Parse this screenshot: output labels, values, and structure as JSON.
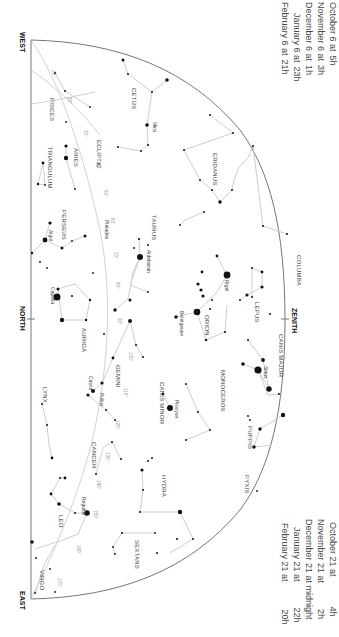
{
  "chart": {
    "directions": {
      "west": "WEST",
      "north": "NORTH",
      "east": "EAST",
      "zenith": "ZENITH"
    },
    "ecliptic_label": "ECLIPTIC",
    "ecliptic_degrees": [
      "10°",
      "20°",
      "30°",
      "40°",
      "50°",
      "60°",
      "70°",
      "80°",
      "90°",
      "100°",
      "110°",
      "120°",
      "130°",
      "140°",
      "150°",
      "160°",
      "170°"
    ],
    "constellations": {
      "pisces": "PISCES",
      "cetus": "CETUS",
      "aries": "ARIES",
      "triangulum": "TRIANGULUM",
      "perseus": "PERSEUS",
      "eridanus": "ERIDANUS",
      "taurus": "TAURUS",
      "auriga": "AURIGA",
      "orion": "ORION",
      "lepus": "LEPUS",
      "columba": "COLUMBA",
      "gemini": "GEMINI",
      "canis_major": "CANIS MAJOR",
      "canis_minor": "CANIS MINOR",
      "monoceros": "MONOCEROS",
      "lynx": "LYNX",
      "cancer": "CANCER",
      "puppis": "PUPPIS",
      "pyxis": "PYXIS",
      "hydra": "HYDRA",
      "leo": "LEO",
      "sextans": "SEXTANS",
      "virgo": "VIRGO"
    },
    "stars": {
      "mira": "Mira",
      "algol": "Algol",
      "pleiades": "Pleiades",
      "aldebaran": "Aldebaran",
      "capella": "Capella",
      "rigel": "Rigel",
      "betelgeuse": "Betelgeuse",
      "sirius": "Sirius",
      "procyon": "Procyon",
      "castor": "Castor",
      "pollux": "Pollux",
      "regulus": "Regulus"
    }
  },
  "viewing_times_early": [
    {
      "date": "October 6 at",
      "time": "5h"
    },
    {
      "date": "November 6 at",
      "time": "3h"
    },
    {
      "date": "December 6 at",
      "time": "1h"
    },
    {
      "date": "January 6 at",
      "time": "23h"
    },
    {
      "date": "February 6 at",
      "time": "21h"
    }
  ],
  "viewing_times_late": [
    {
      "date": "October 21 at",
      "time": "4h"
    },
    {
      "date": "November 21 at",
      "time": "2h"
    },
    {
      "date": "December 21 at midnight",
      "time": ""
    },
    {
      "date": "January 21 at",
      "time": "22h"
    },
    {
      "date": "February 21 at",
      "time": "20h"
    }
  ]
}
